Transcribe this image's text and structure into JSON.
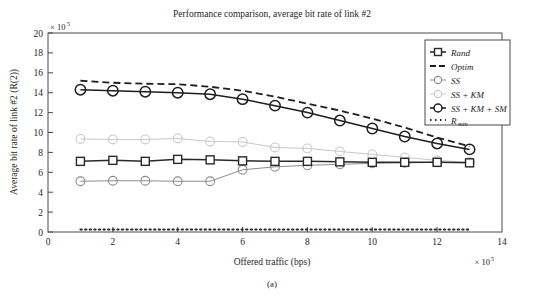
{
  "figure": {
    "caption": "(a)",
    "title": "Performance comparison, average bit rate of link #2",
    "y_exponent_prefix": "× 10",
    "y_exponent_power": "5",
    "x_exponent_prefix": "× 10",
    "x_exponent_power": "5"
  },
  "chart_data": {
    "type": "line",
    "title": "Performance comparison, average bit rate of link #2",
    "xlabel": "Offered traffic (bps)",
    "ylabel": "Average bit rate of link #2 (R(2))",
    "xlim": [
      0,
      14
    ],
    "ylim": [
      0,
      20
    ],
    "x_ticks": [
      0,
      2,
      4,
      6,
      8,
      10,
      12,
      14
    ],
    "y_ticks": [
      0,
      2,
      4,
      6,
      8,
      10,
      12,
      14,
      16,
      18,
      20
    ],
    "x_scale_note": "× 10^5",
    "y_scale_note": "× 10^5",
    "grid": false,
    "legend_position": "upper right",
    "x": [
      1,
      2,
      3,
      4,
      5,
      6,
      7,
      8,
      9,
      10,
      11,
      12,
      13
    ],
    "series": [
      {
        "name": "Rand",
        "marker": "square",
        "color": "#2a2a2a",
        "linestyle": "solid",
        "values": [
          7.1,
          7.2,
          7.1,
          7.3,
          7.25,
          7.15,
          7.1,
          7.1,
          7.05,
          7.0,
          7.0,
          7.0,
          6.95
        ]
      },
      {
        "name": "Optim",
        "marker": "none",
        "color": "#1e1e1e",
        "linestyle": "dashed",
        "values": [
          15.2,
          15.0,
          14.9,
          14.85,
          14.6,
          14.2,
          13.6,
          12.9,
          12.2,
          11.4,
          10.5,
          9.5,
          8.6
        ]
      },
      {
        "name": "SS",
        "marker": "circle",
        "color": "#8c8c8c",
        "linestyle": "solid",
        "values": [
          5.1,
          5.15,
          5.15,
          5.1,
          5.1,
          6.25,
          6.55,
          6.7,
          6.8,
          6.9,
          6.95,
          7.0,
          7.0
        ]
      },
      {
        "name": "SS + KM",
        "marker": "circle",
        "color": "#c8c8c8",
        "linestyle": "solid",
        "values": [
          9.35,
          9.3,
          9.3,
          9.4,
          9.1,
          9.05,
          8.5,
          8.4,
          8.1,
          7.8,
          7.5,
          7.2,
          7.0
        ]
      },
      {
        "name": "SS + KM + SM",
        "marker": "circle",
        "color": "#1e1e1e",
        "linestyle": "solid",
        "values": [
          14.3,
          14.2,
          14.1,
          14.0,
          13.85,
          13.35,
          12.7,
          12.0,
          11.2,
          10.4,
          9.6,
          8.9,
          8.3
        ]
      },
      {
        "name": "R_min",
        "marker": "none",
        "color": "#2a2a2a",
        "linestyle": "dotted",
        "values": [
          0.25,
          0.25,
          0.25,
          0.25,
          0.25,
          0.25,
          0.25,
          0.25,
          0.25,
          0.25,
          0.25,
          0.25,
          0.25
        ]
      }
    ],
    "legend": [
      {
        "label": "Rand",
        "marker": "square-line",
        "color": "#2a2a2a"
      },
      {
        "label": "Optim",
        "marker": "dashed-line",
        "color": "#1e1e1e"
      },
      {
        "label": "SS",
        "marker": "circle-line",
        "color": "#8c8c8c"
      },
      {
        "label": "SS + KM",
        "marker": "circle-line",
        "color": "#c8c8c8"
      },
      {
        "label": "SS + KM + SM",
        "marker": "circle-line",
        "color": "#1e1e1e"
      },
      {
        "label": "R",
        "sublabel": "min",
        "marker": "dotted-line",
        "color": "#2a2a2a"
      }
    ]
  }
}
